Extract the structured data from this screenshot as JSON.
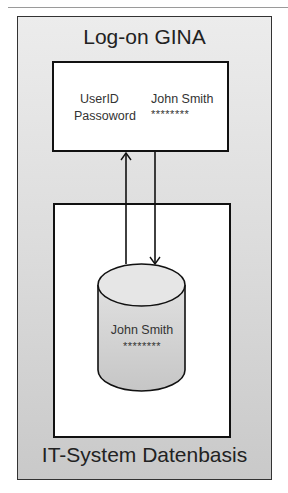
{
  "diagram": {
    "outer_title": "Log-on GINA",
    "outer_footer": "IT-System Datenbasis",
    "login_box": {
      "fields": [
        {
          "label": "UserID",
          "value": "John Smith"
        },
        {
          "label": "Passoword",
          "value": "********"
        }
      ]
    },
    "database": {
      "shape": "cylinder",
      "name": "John Smith",
      "password": "********"
    },
    "arrows": [
      {
        "from": "database",
        "to": "login_box",
        "direction": "up"
      },
      {
        "from": "login_box",
        "to": "database",
        "direction": "down"
      }
    ],
    "colors": {
      "outer_fill_top": "#ececec",
      "outer_fill_bottom": "#c9c9c9",
      "box_fill": "#ffffff",
      "cylinder_fill": "#d4d4d4",
      "stroke": "#111111"
    }
  }
}
